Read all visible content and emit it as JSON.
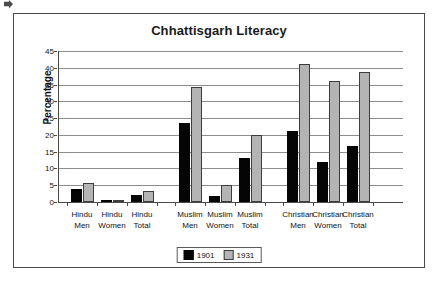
{
  "chart_data": {
    "type": "bar",
    "title": "Chhattisgarh Literacy",
    "xlabel": "",
    "ylabel": "Percentage",
    "ylim": [
      0,
      45
    ],
    "ytick_step": 5,
    "yticks": [
      0,
      5,
      10,
      15,
      20,
      25,
      30,
      35,
      40,
      45
    ],
    "grid": true,
    "legend_position": "bottom",
    "categories": [
      "Hindu Men",
      "Hindu Women",
      "Hindu Total",
      "Muslim Men",
      "Muslim Women",
      "Muslim Total",
      "Christian Men",
      "Christian Women",
      "Christian Total"
    ],
    "category_lines": [
      [
        "Hindu",
        "Men"
      ],
      [
        "Hindu",
        "Women"
      ],
      [
        "Hindu",
        "Total"
      ],
      [
        "Muslim",
        "Men"
      ],
      [
        "Muslim",
        "Women"
      ],
      [
        "Muslim",
        "Total"
      ],
      [
        "Christian",
        "Men"
      ],
      [
        "Christian",
        "Women"
      ],
      [
        "Christian",
        "Total"
      ]
    ],
    "series": [
      {
        "name": "1901",
        "color": "#050505",
        "values": [
          3.8,
          0.2,
          2.2,
          23.5,
          1.7,
          13.0,
          21.2,
          12.0,
          16.8
        ]
      },
      {
        "name": "1931",
        "color": "#b4b4b4",
        "values": [
          5.6,
          0.6,
          3.3,
          34.2,
          5.0,
          20.0,
          41.2,
          36.0,
          38.6
        ]
      }
    ]
  },
  "legend": {
    "items": [
      {
        "label": "1901",
        "series": "s1901"
      },
      {
        "label": "1931",
        "series": "s1931"
      }
    ]
  },
  "colors": {
    "series_1901": "#050505",
    "series_1931": "#b4b4b4",
    "gridline": "#8d8d8d",
    "axis": "#4a4a4a",
    "frame": "#4a4a4a",
    "text": "#111111",
    "background": "#ffffff"
  }
}
